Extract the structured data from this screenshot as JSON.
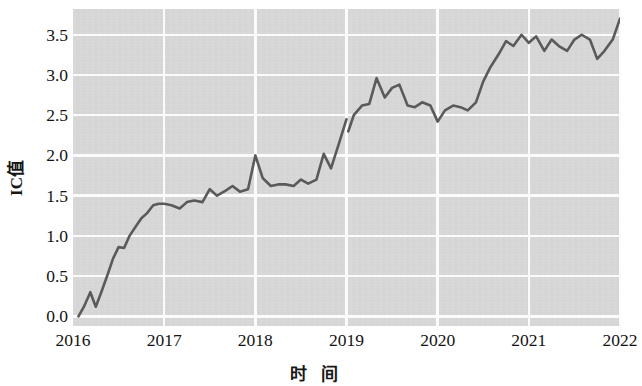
{
  "chart_data": {
    "type": "line",
    "title": "",
    "xlabel": "时 间",
    "ylabel": "IC值",
    "xlim": [
      2016.0,
      2022.0
    ],
    "ylim": [
      -0.12,
      3.82
    ],
    "xticks": [
      "2016",
      "2017",
      "2018",
      "2019",
      "2020",
      "2021",
      "2022"
    ],
    "xtick_values": [
      2016,
      2017,
      2018,
      2019,
      2020,
      2021,
      2022
    ],
    "yticks": [
      "0.0",
      "0.5",
      "1.0",
      "1.5",
      "2.0",
      "2.5",
      "3.0",
      "3.5"
    ],
    "ytick_values": [
      0.0,
      0.5,
      1.0,
      1.5,
      2.0,
      2.5,
      3.0,
      3.5
    ],
    "grid": true,
    "grid_color": "#ffffff",
    "plot_bgcolor": "#d6d6d6",
    "figure_bgcolor": "#ffffff",
    "line_color": "#5a5a5a",
    "line_width": 2.6,
    "legend": null,
    "series": [
      {
        "name": "IC值 累计",
        "segment": "2016-2019",
        "x": [
          2016.06,
          2016.12,
          2016.19,
          2016.25,
          2016.31,
          2016.38,
          2016.44,
          2016.5,
          2016.56,
          2016.62,
          2016.69,
          2016.75,
          2016.81,
          2016.88,
          2016.94,
          2017.0,
          2017.08,
          2017.17,
          2017.25,
          2017.33,
          2017.42,
          2017.5,
          2017.58,
          2017.67,
          2017.75,
          2017.83,
          2017.92,
          2018.0,
          2018.08,
          2018.17,
          2018.25,
          2018.33,
          2018.42,
          2018.5,
          2018.58,
          2018.67,
          2018.75,
          2018.83,
          2018.92,
          2019.0
        ],
        "y": [
          0.0,
          0.12,
          0.3,
          0.12,
          0.3,
          0.52,
          0.72,
          0.86,
          0.85,
          1.0,
          1.12,
          1.22,
          1.28,
          1.38,
          1.4,
          1.4,
          1.38,
          1.34,
          1.42,
          1.44,
          1.42,
          1.58,
          1.5,
          1.56,
          1.62,
          1.55,
          1.58,
          2.0,
          1.72,
          1.62,
          1.64,
          1.64,
          1.62,
          1.7,
          1.65,
          1.7,
          2.02,
          1.84,
          2.16,
          2.45
        ]
      },
      {
        "name": "IC值 累计",
        "segment": "2019-2022",
        "x": [
          2019.02,
          2019.08,
          2019.17,
          2019.25,
          2019.33,
          2019.42,
          2019.5,
          2019.58,
          2019.67,
          2019.75,
          2019.83,
          2019.92,
          2020.0,
          2020.08,
          2020.17,
          2020.25,
          2020.33,
          2020.42,
          2020.5,
          2020.58,
          2020.67,
          2020.75,
          2020.83,
          2020.92,
          2021.0,
          2021.08,
          2021.17,
          2021.25,
          2021.33,
          2021.42,
          2021.5,
          2021.58,
          2021.67,
          2021.75,
          2021.83,
          2021.92,
          2022.0
        ],
        "y": [
          2.3,
          2.5,
          2.62,
          2.64,
          2.96,
          2.72,
          2.84,
          2.88,
          2.62,
          2.6,
          2.66,
          2.62,
          2.42,
          2.56,
          2.62,
          2.6,
          2.56,
          2.66,
          2.92,
          3.1,
          3.26,
          3.42,
          3.36,
          3.5,
          3.4,
          3.48,
          3.3,
          3.44,
          3.36,
          3.3,
          3.44,
          3.5,
          3.44,
          3.2,
          3.3,
          3.44,
          3.7
        ]
      }
    ]
  },
  "axis": {
    "ylabel_text": "IC值",
    "xlabel_text": "时 间"
  }
}
